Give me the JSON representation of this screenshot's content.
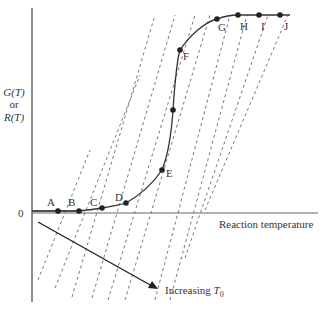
{
  "figure": {
    "y_axis_label_line1": "G(T)",
    "y_axis_label_or": "or",
    "y_axis_label_line2": "R(T)",
    "origin_label": "0",
    "x_axis_label": "Reaction temperature",
    "arrow_label_prefix": "Increasing ",
    "arrow_label_var": "T",
    "arrow_label_sub": "0",
    "points": [
      {
        "label": "A",
        "x": 58,
        "y": 211
      },
      {
        "label": "B",
        "x": 79,
        "y": 211
      },
      {
        "label": "C",
        "x": 102,
        "y": 208
      },
      {
        "label": "D",
        "x": 126,
        "y": 203
      },
      {
        "label": "E",
        "x": 162,
        "y": 170
      },
      {
        "label": "",
        "x": 173,
        "y": 110
      },
      {
        "label": "F",
        "x": 180,
        "y": 50
      },
      {
        "label": "G",
        "x": 217,
        "y": 19
      },
      {
        "label": "H",
        "x": 238,
        "y": 15
      },
      {
        "label": "I",
        "x": 259,
        "y": 15
      },
      {
        "label": "J",
        "x": 280,
        "y": 15
      }
    ],
    "colors": {
      "axis": "#555555",
      "curve": "#333333",
      "dash": "#555555",
      "text": "#333333"
    }
  }
}
